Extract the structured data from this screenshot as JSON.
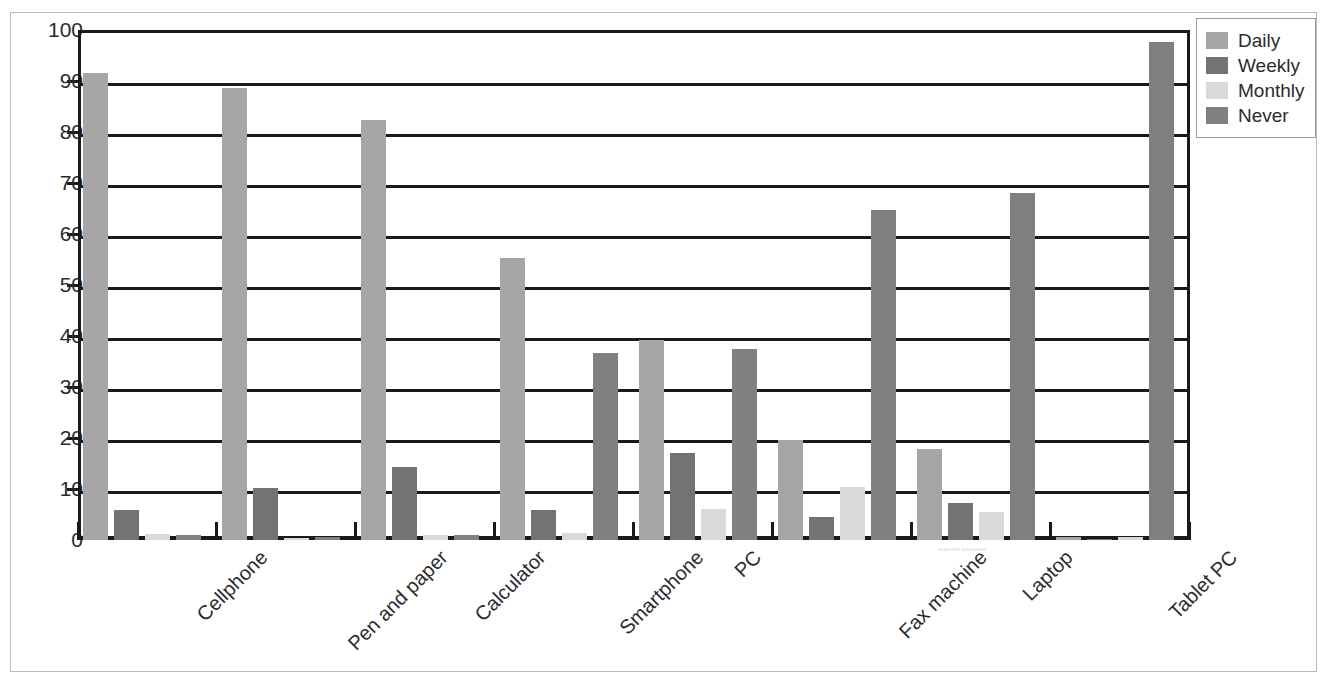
{
  "chart_data": {
    "type": "bar",
    "title": "",
    "xlabel": "",
    "ylabel": "",
    "ylim": [
      0,
      100
    ],
    "ytick_step": 10,
    "ytick_labels": [
      "0",
      "10",
      "20",
      "30",
      "40",
      "50",
      "60",
      "70",
      "80",
      "90",
      "100"
    ],
    "grid": true,
    "legend_position": "top-right",
    "categories": [
      "Cellphone",
      "Pen and paper",
      "Calculator",
      "Smartphone",
      "PC",
      "Fax machine",
      "Laptop",
      "Tablet PC"
    ],
    "series": [
      {
        "name": "Daily",
        "color": "#a6a6a6",
        "values": [
          91.5,
          88.6,
          82.4,
          55.3,
          39.3,
          19.7,
          17.8,
          0.6
        ]
      },
      {
        "name": "Weekly",
        "color": "#737373",
        "values": [
          5.9,
          10.2,
          14.3,
          5.9,
          17.0,
          4.6,
          7.2,
          0.2
        ]
      },
      {
        "name": "Monthly",
        "color": "#d9d9d9",
        "values": [
          1.2,
          0.3,
          1.0,
          1.4,
          6.0,
          10.4,
          5.5,
          0.5
        ]
      },
      {
        "name": "Never",
        "color": "#808080",
        "values": [
          1.0,
          0.5,
          1.0,
          36.7,
          37.5,
          64.8,
          68.0,
          97.7
        ]
      }
    ]
  },
  "legend": {
    "items": [
      {
        "label": "Daily",
        "color": "#a6a6a6"
      },
      {
        "label": "Weekly",
        "color": "#737373"
      },
      {
        "label": "Monthly",
        "color": "#d9d9d9"
      },
      {
        "label": "Never",
        "color": "#808080"
      }
    ]
  },
  "artifact": {
    "text": "scanned document"
  }
}
